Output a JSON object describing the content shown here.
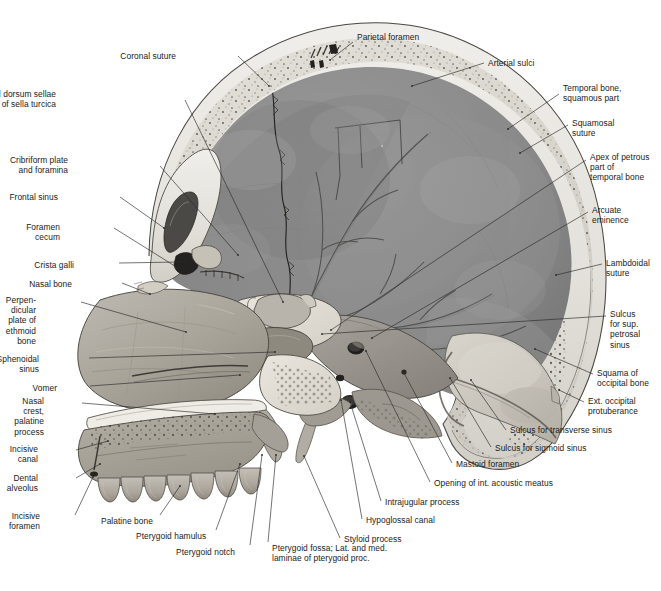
{
  "figure": {
    "type": "anatomical-illustration",
    "background_color": "#ffffff",
    "ink_color": "#1b1b1b",
    "palette": {
      "outer_table": "#e7e5e0",
      "diploe": "#d9d6cf",
      "cranial_cavity": "#8d8d8d",
      "cranial_cavity_dark": "#6f6f6f",
      "facial_bone": "#a9a49c",
      "spongy_bone": "#ded9d1",
      "tooth": "#b8b3aa",
      "occipital_squama": "#c9c5bd",
      "leader_line": "#2a2a2a"
    }
  },
  "labels": [
    {
      "id": "parietal-foramen",
      "text": "Parietal foramen",
      "align": "left",
      "x": 357,
      "y": 32,
      "lx": 353,
      "ly": 42,
      "tx": 330,
      "ty": 60
    },
    {
      "id": "coronal-suture",
      "text": "Coronal suture",
      "align": "right",
      "x": 176,
      "y": 51,
      "lx": 238,
      "ly": 56,
      "tx": 269,
      "ty": 86
    },
    {
      "id": "arterial-sulci",
      "text": "Arterial sulci",
      "align": "left",
      "x": 488,
      "y": 58,
      "lx": 484,
      "ly": 63,
      "tx": 412,
      "ty": 86
    },
    {
      "id": "tuberculum-dorsum-sellae",
      "text": "Tuberculum and dorsum sellae\nof sella turcica",
      "align": "right",
      "x": 56,
      "y": 89,
      "lx": 185,
      "ly": 100,
      "tx": 283,
      "ty": 302
    },
    {
      "id": "temporal-bone-squamous",
      "text": "Temporal bone,\nsquamous part",
      "align": "left",
      "x": 563,
      "y": 83,
      "lx": 559,
      "ly": 94,
      "tx": 508,
      "ty": 129
    },
    {
      "id": "squamosal-suture",
      "text": "Squamosal\nsuture",
      "align": "left",
      "x": 572,
      "y": 118,
      "lx": 568,
      "ly": 125,
      "tx": 520,
      "ty": 153
    },
    {
      "id": "cribriform-plate",
      "text": "Cribriform plate\nand foramina",
      "align": "right",
      "x": 68,
      "y": 155,
      "lx": 160,
      "ly": 166,
      "tx": 238,
      "ty": 255
    },
    {
      "id": "apex-petrous",
      "text": "Apex of petrous\npart of\ntemporal bone",
      "align": "left",
      "x": 590,
      "y": 152,
      "lx": 586,
      "ly": 160,
      "tx": 331,
      "ty": 330
    },
    {
      "id": "frontal-sinus",
      "text": "Frontal sinus",
      "align": "right",
      "x": 58,
      "y": 192,
      "lx": 120,
      "ly": 197,
      "tx": 164,
      "ty": 228
    },
    {
      "id": "arcuate-eminence",
      "text": "Arcuate\neminence",
      "align": "left",
      "x": 592,
      "y": 205,
      "lx": 588,
      "ly": 212,
      "tx": 372,
      "ty": 338
    },
    {
      "id": "foramen-cecum",
      "text": "Foramen\ncecum",
      "align": "right",
      "x": 60,
      "y": 222,
      "lx": 114,
      "ly": 228,
      "tx": 178,
      "ty": 268
    },
    {
      "id": "crista-galli",
      "text": "Crista galli",
      "align": "right",
      "x": 74,
      "y": 260,
      "lx": 119,
      "ly": 263,
      "tx": 180,
      "ty": 262
    },
    {
      "id": "lambdoidal-suture",
      "text": "Lambdoidal\nsuture",
      "align": "left",
      "x": 606,
      "y": 258,
      "lx": 602,
      "ly": 264,
      "tx": 556,
      "ty": 275
    },
    {
      "id": "nasal-bone",
      "text": "Nasal bone",
      "align": "right",
      "x": 72,
      "y": 279,
      "lx": 122,
      "ly": 283,
      "tx": 150,
      "ty": 294
    },
    {
      "id": "perpendicular-plate",
      "text": "Perpen-\ndicular\nplate of\nethmoid\nbone",
      "align": "right",
      "x": 36,
      "y": 295,
      "lx": 81,
      "ly": 302,
      "tx": 186,
      "ty": 332
    },
    {
      "id": "sulcus-sup-petrosal",
      "text": "Sulcus\nfor sup.\npetrosal\nsinus",
      "align": "left",
      "x": 610,
      "y": 309,
      "lx": 606,
      "ly": 316,
      "tx": 322,
      "ty": 334
    },
    {
      "id": "sphenoidal-sinus",
      "text": "Sphenoidal\nsinus",
      "align": "right",
      "x": 39,
      "y": 354,
      "lx": 89,
      "ly": 358,
      "tx": 275,
      "ty": 352
    },
    {
      "id": "squama-occipital",
      "text": "Squama of\noccipital bone",
      "align": "left",
      "x": 597,
      "y": 368,
      "lx": 593,
      "ly": 374,
      "tx": 535,
      "ty": 349
    },
    {
      "id": "vomer",
      "text": "Vomer",
      "align": "right",
      "x": 57,
      "y": 383,
      "lx": 90,
      "ly": 386,
      "tx": 240,
      "ty": 375
    },
    {
      "id": "ext-occipital-prot",
      "text": "Ext. occipital\nprotuberance",
      "align": "left",
      "x": 588,
      "y": 396,
      "lx": 584,
      "ly": 402,
      "tx": 559,
      "ty": 390
    },
    {
      "id": "nasal-crest",
      "text": "Nasal\ncrest,\npalatine\nprocess",
      "align": "right",
      "x": 44,
      "y": 396,
      "lx": 82,
      "ly": 403,
      "tx": 215,
      "ty": 414
    },
    {
      "id": "incisive-canal",
      "text": "Incisive\ncanal",
      "align": "right",
      "x": 38,
      "y": 444,
      "lx": 76,
      "ly": 450,
      "tx": 108,
      "ty": 441
    },
    {
      "id": "sulcus-transverse",
      "text": "Sulcus for transverse sinus",
      "align": "left",
      "x": 510,
      "y": 425,
      "lx": 506,
      "ly": 430,
      "tx": 471,
      "ty": 380
    },
    {
      "id": "sulcus-sigmoid",
      "text": "Sulcus for sigmoid sinus",
      "align": "left",
      "x": 495,
      "y": 443,
      "lx": 491,
      "ly": 447,
      "tx": 450,
      "ty": 378
    },
    {
      "id": "dental-alveolus",
      "text": "Dental\nalveolus",
      "align": "right",
      "x": 38,
      "y": 473,
      "lx": 76,
      "ly": 478,
      "tx": 100,
      "ty": 464
    },
    {
      "id": "mastoid-foramen",
      "text": "Mastoid foramen",
      "align": "left",
      "x": 456,
      "y": 459,
      "lx": 452,
      "ly": 463,
      "tx": 404,
      "ty": 373
    },
    {
      "id": "opening-int-acoustic",
      "text": "Opening of int. acoustic meatus",
      "align": "left",
      "x": 434,
      "y": 478,
      "lx": 430,
      "ly": 482,
      "tx": 366,
      "ty": 351
    },
    {
      "id": "intrajugular-process",
      "text": "Intrajugular process",
      "align": "left",
      "x": 385,
      "y": 497,
      "lx": 381,
      "ly": 501,
      "tx": 350,
      "ty": 402
    },
    {
      "id": "hypoglossal-canal",
      "text": "Hypoglossal canal",
      "align": "left",
      "x": 366,
      "y": 515,
      "lx": 362,
      "ly": 519,
      "tx": 341,
      "ty": 400
    },
    {
      "id": "incisive-foramen",
      "text": "Incisive\nforamen",
      "align": "right",
      "x": 40,
      "y": 511,
      "lx": 75,
      "ly": 515,
      "tx": 93,
      "ty": 477
    },
    {
      "id": "styloid-process",
      "text": "Styloid process",
      "align": "left",
      "x": 344,
      "y": 534,
      "lx": 340,
      "ly": 538,
      "tx": 304,
      "ty": 456
    },
    {
      "id": "palatine-bone",
      "text": "Palatine bone",
      "align": "left",
      "x": 101,
      "y": 516,
      "lx": 160,
      "ly": 515,
      "tx": 180,
      "ty": 486
    },
    {
      "id": "pterygoid-hamulus",
      "text": "Pterygoid hamulus",
      "align": "left",
      "x": 136,
      "y": 531,
      "lx": 216,
      "ly": 530,
      "tx": 240,
      "ty": 464
    },
    {
      "id": "pterygoid-notch",
      "text": "Pterygoid notch",
      "align": "left",
      "x": 176,
      "y": 547,
      "lx": 250,
      "ly": 545,
      "tx": 262,
      "ty": 455
    },
    {
      "id": "pterygoid-fossa",
      "text": "Pterygoid fossa; Lat. and med.\nlaminae of pterygoid proc.",
      "align": "left",
      "x": 272,
      "y": 543,
      "lx": 268,
      "ly": 542,
      "tx": 276,
      "ty": 455
    }
  ]
}
